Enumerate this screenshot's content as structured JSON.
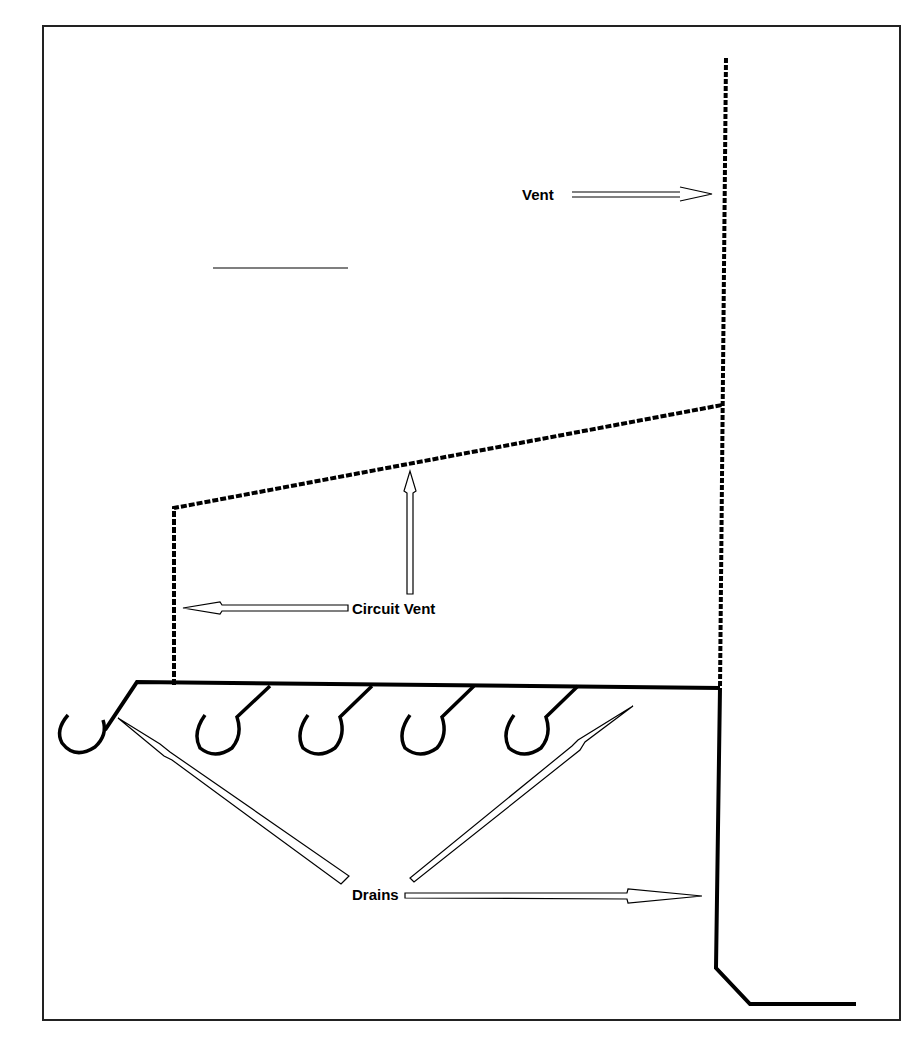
{
  "figure": {
    "type": "plumbing-venting-diagram",
    "frame_color": "#222222",
    "line_color": "#000000"
  },
  "labels": {
    "vent": "Vent",
    "circuit_vent": "Circuit Vent",
    "drains": "Drains"
  },
  "elements": {
    "vent_stack": {
      "style": "dashed",
      "description": "vertical vent stack on right"
    },
    "circuit_vent_line": {
      "style": "dashed",
      "description": "sloped circuit vent connecting to stack"
    },
    "horizontal_drain": {
      "style": "solid"
    },
    "traps": {
      "count": 5,
      "shape": "P-trap"
    },
    "drain_stack": {
      "style": "solid",
      "description": "vertical drain stack turning to horizontal building drain"
    }
  },
  "arrows": [
    {
      "from": "vent",
      "direction": "right"
    },
    {
      "from": "circuit_vent",
      "direction": "left"
    },
    {
      "from": "circuit_vent",
      "direction": "up"
    },
    {
      "from": "drains",
      "direction": "up-left"
    },
    {
      "from": "drains",
      "direction": "up-right"
    },
    {
      "from": "drains",
      "direction": "right"
    }
  ]
}
